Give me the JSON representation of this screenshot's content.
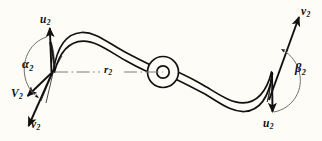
{
  "figure": {
    "kind": "engineering-vector-diagram",
    "background_color": "#fdfcf7",
    "ink_color": "#111111"
  },
  "labels": {
    "u2_top_left": {
      "symbol": "u",
      "subscript": "2"
    },
    "u2_bottom_right": {
      "symbol": "u",
      "subscript": "2"
    },
    "v2_bottom_left": {
      "symbol": "v",
      "subscript": "2"
    },
    "v2_top_right": {
      "symbol": "v",
      "subscript": "2"
    },
    "V2_left": {
      "symbol": "V",
      "subscript": "2"
    },
    "alpha2": {
      "symbol": "α",
      "subscript": "2"
    },
    "beta2": {
      "symbol": "β",
      "subscript": "2"
    },
    "r2": {
      "symbol": "r",
      "subscript": "2"
    }
  },
  "annotations": {
    "centerline_style": "dash-dot",
    "hub": "concentric-double-circle",
    "left_blade_tip": "narrow-dark-sliver",
    "right_blade_tip": "narrow-dark-sliver"
  }
}
